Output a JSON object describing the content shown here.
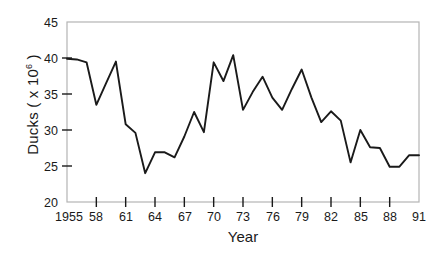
{
  "chart_data": {
    "type": "line",
    "title": "",
    "xlabel": "Year",
    "ylabel_text": "Ducks ( x 10",
    "ylabel_exponent": "6",
    "ylabel_tail": " )",
    "ylabel_full": "Ducks ( x 10^6 )",
    "xlim": [
      1955,
      1991
    ],
    "ylim": [
      20,
      45
    ],
    "grid": false,
    "legend": "none",
    "yticks": [
      20,
      25,
      30,
      35,
      40,
      45
    ],
    "ytick_labels": [
      "20",
      "25",
      "30",
      "35",
      "40",
      "45"
    ],
    "xticks": [
      1955,
      1958,
      1961,
      1964,
      1967,
      1970,
      1973,
      1976,
      1979,
      1982,
      1985,
      1988,
      1991
    ],
    "xtick_labels": [
      "1955",
      "58",
      "61",
      "64",
      "67",
      "70",
      "73",
      "76",
      "79",
      "82",
      "85",
      "88",
      "91"
    ],
    "series": [
      {
        "name": "Ducks",
        "color": "#1a1a1a",
        "x": [
          1955,
          1956,
          1957,
          1958,
          1959,
          1960,
          1961,
          1962,
          1963,
          1964,
          1965,
          1966,
          1967,
          1968,
          1969,
          1970,
          1971,
          1972,
          1973,
          1974,
          1975,
          1976,
          1977,
          1978,
          1979,
          1980,
          1981,
          1982,
          1983,
          1984,
          1985,
          1986,
          1987,
          1988,
          1989,
          1990,
          1991
        ],
        "values": [
          39.9,
          39.8,
          39.4,
          33.5,
          36.5,
          39.5,
          30.8,
          29.6,
          24.0,
          26.9,
          26.9,
          26.2,
          29.1,
          32.5,
          29.7,
          39.4,
          36.8,
          40.4,
          32.8,
          35.3,
          37.4,
          34.5,
          32.8,
          35.7,
          38.4,
          34.5,
          31.1,
          32.6,
          31.3,
          25.5,
          30.0,
          27.6,
          27.5,
          24.9,
          24.9,
          26.5,
          26.5
        ]
      }
    ]
  },
  "axes": {
    "frame_color": "#b4b4b4",
    "line_color": "#1a1a1a"
  }
}
